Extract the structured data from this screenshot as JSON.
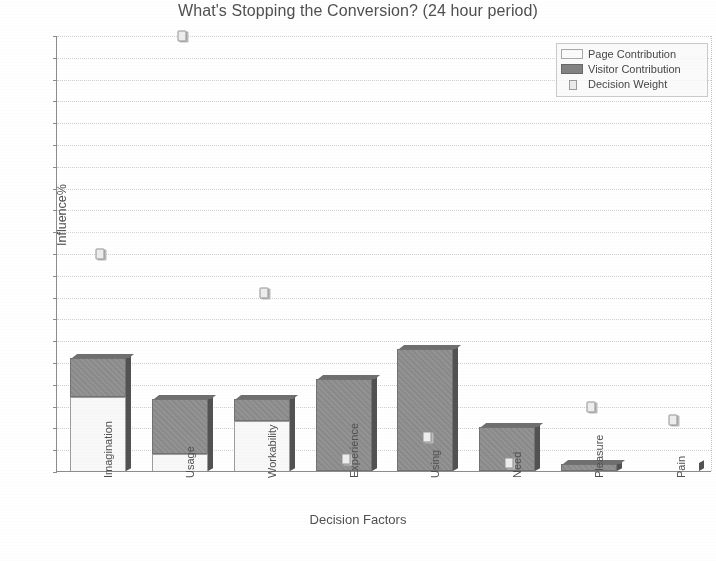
{
  "chart_data": {
    "type": "bar",
    "title": "What's Stopping the Conversion? (24 hour period)",
    "xlabel": "Decision Factors",
    "ylabel": "Influence%",
    "ylim": [
      0,
      100
    ],
    "ytick_step": 5,
    "grid": true,
    "stacked": true,
    "legend_position": "top-right",
    "categories": [
      "Imagination",
      "Usage",
      "Workability",
      "Experience",
      "Using",
      "Need",
      "Pleasure",
      "Pain"
    ],
    "yticks": [
      100,
      95,
      90,
      85,
      80,
      75,
      70,
      65,
      60,
      55,
      50,
      45,
      40,
      35,
      30,
      25,
      20,
      15,
      10,
      5,
      0
    ],
    "series": [
      {
        "name": "Page Contribution",
        "type": "bar",
        "color": "#ffffff",
        "values": [
          17,
          4,
          11.5,
          0,
          0,
          0,
          0,
          0
        ]
      },
      {
        "name": "Visitor Contribution",
        "type": "bar",
        "color": "#8d8d8d",
        "values": [
          9,
          12.5,
          5,
          21,
          28,
          10,
          1.5,
          0
        ]
      },
      {
        "name": "Decision Weight",
        "type": "scatter",
        "color": "#efefef",
        "values": [
          50,
          100,
          41,
          3,
          8,
          2,
          15,
          12
        ]
      }
    ],
    "totals": [
      26,
      16.5,
      16.5,
      21,
      28,
      10,
      1.5,
      0
    ]
  },
  "legend": {
    "items": [
      {
        "label": "Page Contribution",
        "swatch": "page-contribution-swatch"
      },
      {
        "label": "Visitor Contribution",
        "swatch": "visitor-contribution-swatch"
      },
      {
        "label": "Decision Weight",
        "swatch": "decision-weight-swatch"
      }
    ]
  }
}
